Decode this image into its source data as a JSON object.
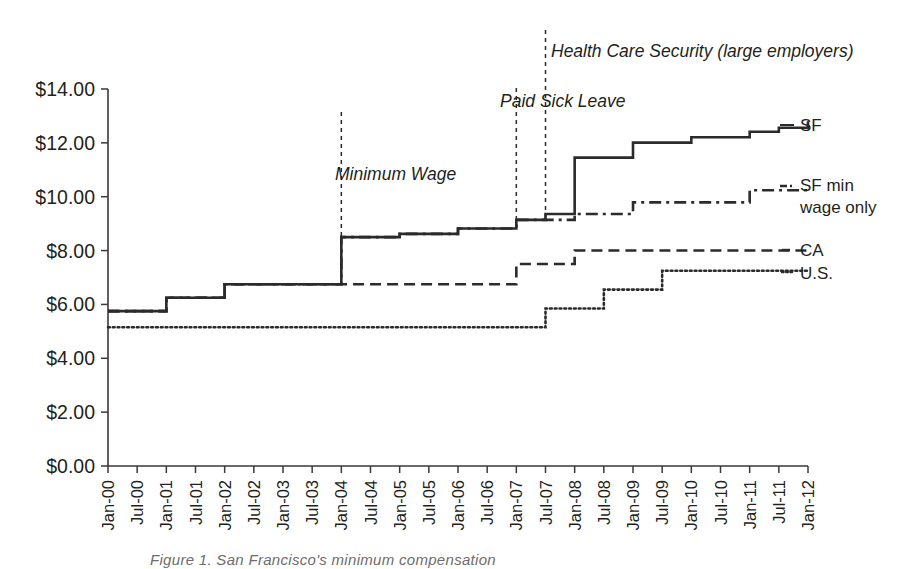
{
  "chart_data": {
    "type": "line",
    "title": "",
    "xlabel": "",
    "ylabel": "",
    "ylim": [
      0,
      14
    ],
    "xlim": [
      "Jan-00",
      "Jan-12"
    ],
    "grid": false,
    "legend_position": "right-of-plot (direct series labels)",
    "ytick_labels": [
      "$0.00",
      "$2.00",
      "$4.00",
      "$6.00",
      "$8.00",
      "$10.00",
      "$12.00",
      "$14.00"
    ],
    "ytick_values": [
      0,
      2,
      4,
      6,
      8,
      10,
      12,
      14
    ],
    "categories": [
      "Jan-00",
      "Jul-00",
      "Jan-01",
      "Jul-01",
      "Jan-02",
      "Jul-02",
      "Jan-03",
      "Jul-03",
      "Jan-04",
      "Jul-04",
      "Jan-05",
      "Jul-05",
      "Jan-06",
      "Jul-06",
      "Jan-07",
      "Jul-07",
      "Jan-08",
      "Jul-08",
      "Jan-09",
      "Jul-09",
      "Jan-10",
      "Jul-10",
      "Jan-11",
      "Jul-11",
      "Jan-12"
    ],
    "series": [
      {
        "name": "SF",
        "label": "SF",
        "style": "solid",
        "values": [
          5.75,
          5.75,
          6.25,
          6.25,
          6.75,
          6.75,
          6.75,
          6.75,
          8.5,
          8.5,
          8.62,
          8.62,
          8.82,
          8.82,
          9.14,
          9.36,
          11.45,
          11.45,
          12.01,
          12.01,
          12.21,
          12.21,
          12.41,
          12.56,
          12.8
        ]
      },
      {
        "name": "SF min wage only",
        "label": "SF min wage only",
        "style": "dash-dot",
        "values": [
          5.75,
          5.75,
          6.25,
          6.25,
          6.75,
          6.75,
          6.75,
          6.75,
          8.5,
          8.5,
          8.62,
          8.62,
          8.82,
          8.82,
          9.14,
          9.14,
          9.36,
          9.36,
          9.79,
          9.79,
          9.79,
          9.79,
          10.24,
          10.24,
          10.24
        ]
      },
      {
        "name": "CA",
        "label": "CA",
        "style": "dashed",
        "values": [
          5.75,
          5.75,
          6.25,
          6.25,
          6.75,
          6.75,
          6.75,
          6.75,
          6.75,
          6.75,
          6.75,
          6.75,
          6.75,
          6.75,
          7.5,
          7.5,
          8.0,
          8.0,
          8.0,
          8.0,
          8.0,
          8.0,
          8.0,
          8.0,
          8.0
        ]
      },
      {
        "name": "U.S.",
        "label": "U.S.",
        "style": "dotted",
        "values": [
          5.15,
          5.15,
          5.15,
          5.15,
          5.15,
          5.15,
          5.15,
          5.15,
          5.15,
          5.15,
          5.15,
          5.15,
          5.15,
          5.15,
          5.15,
          5.85,
          5.85,
          6.55,
          6.55,
          7.25,
          7.25,
          7.25,
          7.25,
          7.25,
          7.25
        ]
      }
    ],
    "annotations": [
      {
        "text": "Minimum Wage",
        "at_x": "Jan-04",
        "value_note": "vertical dashed marker at SF minimum wage ordinance step"
      },
      {
        "text": "Paid Sick Leave",
        "at_x": "Jan-07",
        "value_note": "vertical dashed marker at paid sick leave ordinance"
      },
      {
        "text": "Health Care Security (large employers)",
        "at_x": "Jul-07",
        "value_note": "vertical dashed marker at health care security ordinance"
      }
    ]
  },
  "caption": {
    "text": "Figure 1.  San Francisco's minimum compensation"
  }
}
